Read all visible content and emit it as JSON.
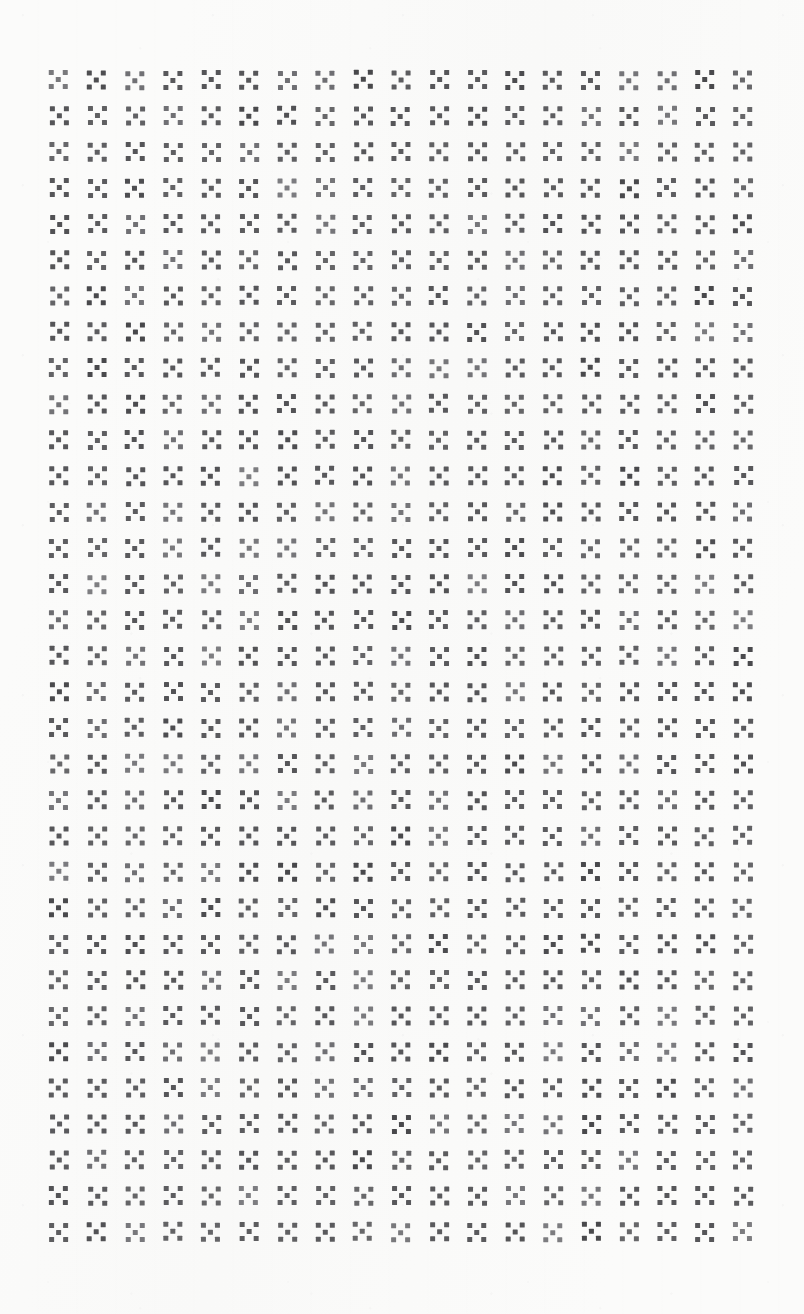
{
  "document": {
    "kind": "scanned-page",
    "title": "Glyph Grid Scan",
    "description": "A scanned sheet filled edge to edge with a uniform repeating printed glyph."
  },
  "canvas": {
    "width": 804,
    "height": 1314,
    "background_color": "#fbfbfa",
    "paper_tint": "#f9f9f8"
  },
  "grid": {
    "columns": 19,
    "rows": 33,
    "total_glyphs": 627,
    "column_pitch_px": 38,
    "row_pitch_px": 36,
    "offset_left_px": 40,
    "offset_top_px": 62,
    "margin_left_px": 48,
    "margin_top_px": 68,
    "margin_right_px": 34,
    "margin_bottom_px": 64
  },
  "glyph": {
    "name": "saltire-square-glyph",
    "label": "X",
    "description": "Three-by-three block matrix with the four corner cells and the center cell inked, forming an X / saltire.",
    "matrix": [
      [
        1,
        0,
        1
      ],
      [
        0,
        1,
        0
      ],
      [
        1,
        0,
        1
      ]
    ],
    "cell_size_px": 5,
    "cell_gap_px": 2,
    "total_size_px": 19,
    "ink_color": "#555558",
    "ink_color_light": "#6d6d71",
    "ink_color_dark": "#48484b"
  },
  "legend": {
    "ink": "#555558",
    "paper": "#fbfbfa"
  }
}
